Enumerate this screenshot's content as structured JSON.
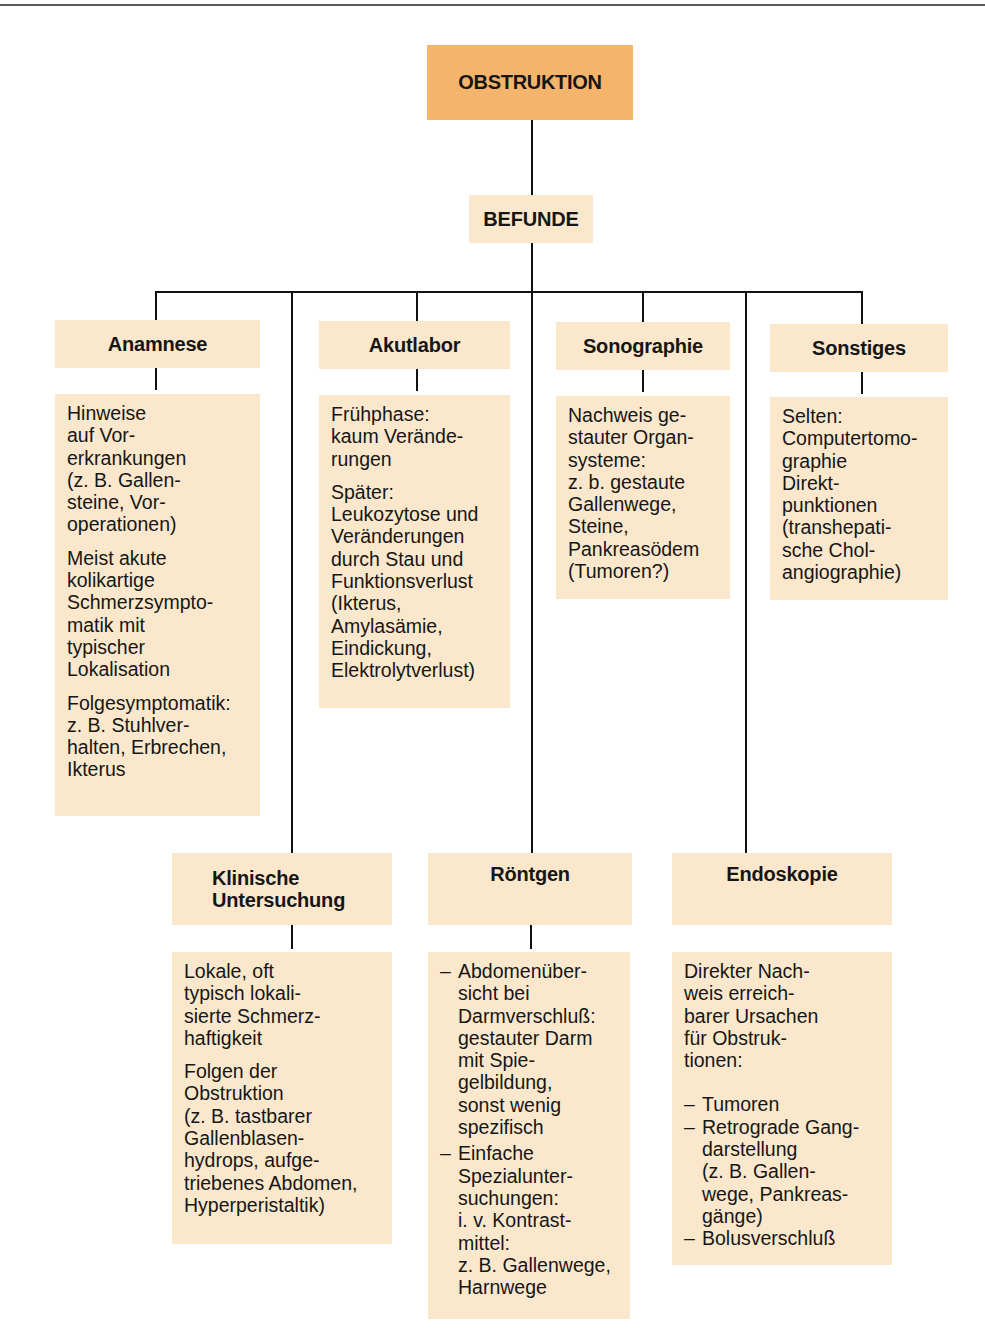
{
  "root": {
    "title": "OBSTRUKTION",
    "color": "#f5b46c"
  },
  "level2": {
    "title": "BEFUNDE"
  },
  "box_color": "#fbe8cc",
  "categories": {
    "anamnese": {
      "title": "Anamnese",
      "paragraphs": [
        "Hinweise\nauf Vor-\nerkrankungen\n(z. B. Gallen-\nsteine, Vor-\noperationen)",
        "Meist akute\nkolikartige\nSchmerzsympto-\nmatik mit\ntypischer\nLokalisation",
        "Folgesymptomatik:\nz. B. Stuhlver-\nhalten, Erbrechen,\nIkterus"
      ]
    },
    "akutlabor": {
      "title": "Akutlabor",
      "paragraphs": [
        "Frühphase:\nkaum Verände-\nrungen",
        "Später:\nLeukozytose und\nVeränderungen\ndurch Stau und\nFunktionsverlust\n(Ikterus,\nAmylasämie,\nEindickung,\nElektrolytverlust)"
      ]
    },
    "sonographie": {
      "title": "Sonographie",
      "paragraphs": [
        "Nachweis ge-\nstauter Organ-\nsysteme:\nz. b. gestaute\nGallenwege,\nSteine,\nPankreasödem\n(Tumoren?)"
      ]
    },
    "sonstiges": {
      "title": "Sonstiges",
      "paragraphs": [
        "Selten:\nComputertomo-\ngraphie\nDirekt-\npunktionen\n(transhepati-\nsche Chol-\nangiographie)"
      ]
    },
    "klinische_untersuchung": {
      "title": "Klinische\nUntersuchung",
      "title_line1": "Klinische",
      "title_line2": "Untersuchung",
      "paragraphs": [
        "Lokale, oft\ntypisch lokali-\nsierte Schmerz-\nhaftigkeit",
        "Folgen der\nObstruktion\n(z. B. tastbarer\nGallenblasen-\nhydrops, aufge-\ntriebenes Abdomen,\nHyperperistaltik)"
      ]
    },
    "roentgen": {
      "title": "Röntgen",
      "bullets": [
        "Abdomenüber-\nsicht bei\nDarmverschluß:\ngestauter Darm\nmit Spie-\ngelbildung,\nsonst wenig\nspezifisch",
        "Einfache\nSpezialunter-\nsuchungen:\ni. v. Kontrast-\nmittel:\nz. B. Gallenwege,\nHarnwege"
      ]
    },
    "endoskopie": {
      "title": "Endoskopie",
      "intro": "Direkter Nach-\nweis erreich-\nbarer Ursachen\nfür Obstruk-\ntionen:",
      "bullets": [
        "Tumoren",
        "Retrograde Gang-\ndarstellung\n(z. B. Gallen-\nwege, Pankreas-\ngänge)",
        "Bolusverschluß"
      ]
    }
  }
}
